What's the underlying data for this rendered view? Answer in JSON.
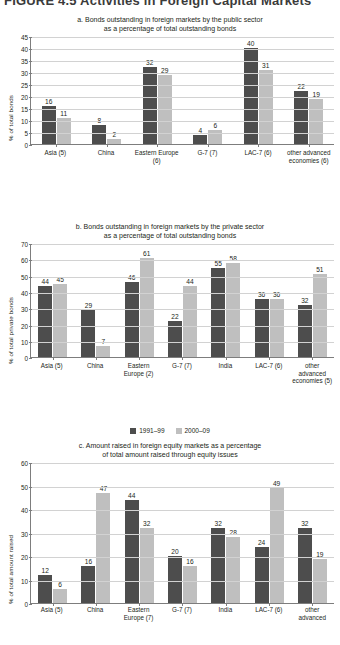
{
  "figure": {
    "heading": "FIGURE 4.5   Activities in Foreign Capital Markets",
    "legend": [
      {
        "label": "1991–99",
        "color": "#4d4d4d"
      },
      {
        "label": "2000–09",
        "color": "#bfbfbf"
      }
    ]
  },
  "chart_data": [
    {
      "id": "a",
      "type": "bar",
      "title": "a. Bonds outstanding in foreign markets by the public sector as a percentage of total outstanding bonds",
      "title_line1": "a. Bonds outstanding in foreign markets by the public sector",
      "title_line2": "as a percentage of total outstanding bonds",
      "xlabel": "",
      "ylabel": "% of total bonds",
      "ylim": [
        0,
        45
      ],
      "yticks": [
        0,
        5,
        10,
        15,
        20,
        25,
        30,
        35,
        40,
        45
      ],
      "grid": true,
      "legend_position": "below-panel-b",
      "categories": [
        "Asia (5)",
        "China",
        "Eastern Europe (6)",
        "G-7 (7)",
        "LAC-7 (6)",
        "other advanced economies (6)"
      ],
      "series": [
        {
          "name": "1991–99",
          "color": "#4d4d4d",
          "values": [
            16,
            8,
            32,
            4,
            40,
            22
          ]
        },
        {
          "name": "2000–09",
          "color": "#bfbfbf",
          "values": [
            11,
            2,
            29,
            6,
            31,
            19
          ]
        }
      ]
    },
    {
      "id": "b",
      "type": "bar",
      "title": "b. Bonds outstanding in foreign markets by the private sector as a percentage of total outstanding bonds",
      "title_line1": "b. Bonds outstanding in foreign markets by the private sector",
      "title_line2": "as a percentage of total outstanding bonds",
      "xlabel": "",
      "ylabel": "% of total private bonds",
      "ylim": [
        0,
        70
      ],
      "yticks": [
        0,
        10,
        20,
        30,
        40,
        50,
        60,
        70
      ],
      "grid": true,
      "categories": [
        "Asia (5)",
        "China",
        "Eastern Europe (2)",
        "G-7 (7)",
        "India",
        "LAC-7 (6)",
        "other advanced economies (5)"
      ],
      "series": [
        {
          "name": "1991–99",
          "color": "#4d4d4d",
          "values": [
            44,
            29,
            46,
            22,
            55,
            36,
            32
          ]
        },
        {
          "name": "2000–09",
          "color": "#bfbfbf",
          "values": [
            45,
            7,
            61,
            44,
            58,
            36,
            51
          ]
        }
      ]
    },
    {
      "id": "c",
      "type": "bar",
      "title": "c. Amount raised in foreign equity markets as a percentage of total amount raised through equity issues",
      "title_line1": "c. Amount raised in foreign equity markets as a percentage",
      "title_line2": "of total amount raised through equity issues",
      "xlabel": "",
      "ylabel": "% of total amount raised",
      "ylim": [
        0,
        60
      ],
      "yticks": [
        0,
        10,
        20,
        30,
        40,
        50,
        60
      ],
      "grid": true,
      "categories": [
        "Asia (5)",
        "China",
        "Eastern Europe (7)",
        "G-7 (7)",
        "India",
        "LAC-7 (6)",
        "other advanced"
      ],
      "series": [
        {
          "name": "1991–99",
          "color": "#4d4d4d",
          "values": [
            12,
            16,
            44,
            20,
            32,
            24,
            32
          ]
        },
        {
          "name": "2000–09",
          "color": "#bfbfbf",
          "values": [
            6,
            47,
            32,
            16,
            28,
            49,
            19
          ]
        }
      ]
    }
  ]
}
